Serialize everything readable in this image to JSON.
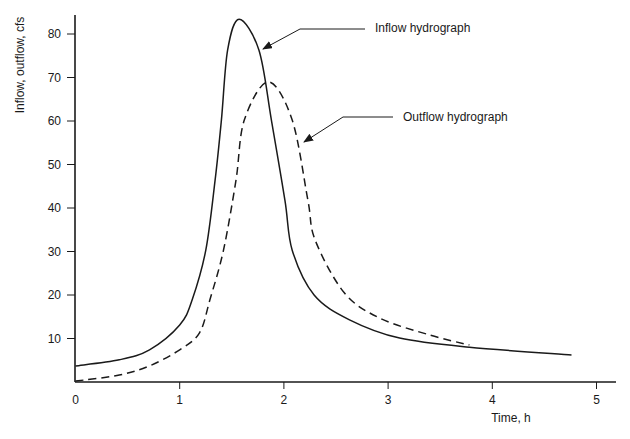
{
  "chart_data": {
    "type": "line",
    "title": "",
    "xlabel": "Time, h",
    "ylabel": "Inflow, outflow, cfs",
    "xlim": [
      0,
      5.2
    ],
    "ylim": [
      0,
      86
    ],
    "xticks": [
      0,
      1,
      2,
      3,
      4,
      5
    ],
    "yticks": [
      10,
      20,
      30,
      40,
      50,
      60,
      70,
      80
    ],
    "grid": false,
    "legend": "none (direct annotations with arrows)",
    "series": [
      {
        "name": "Inflow hydrograph",
        "style": "solid",
        "x": [
          0,
          0.42,
          0.71,
          1.0,
          1.12,
          1.25,
          1.34,
          1.4,
          1.46,
          1.57,
          1.76,
          1.88,
          2.01,
          2.08,
          2.29,
          2.63,
          3.11,
          3.78,
          4.76
        ],
        "y": [
          3.7,
          5.1,
          7.4,
          13.1,
          18.9,
          30.3,
          46.4,
          60.2,
          76.3,
          83.4,
          76.3,
          60.2,
          41.8,
          30.3,
          20.0,
          14.3,
          10.1,
          8.0,
          6.2
        ]
      },
      {
        "name": "Outflow hydrograph",
        "style": "dashed",
        "x": [
          0,
          0.42,
          0.71,
          1.0,
          1.19,
          1.29,
          1.42,
          1.54,
          1.62,
          1.85,
          2.08,
          2.23,
          2.3,
          2.58,
          2.92,
          3.4,
          3.78
        ],
        "y": [
          0.2,
          1.6,
          3.7,
          7.4,
          11.3,
          18.9,
          30.3,
          46.4,
          60.2,
          69.0,
          60.2,
          41.8,
          32.6,
          20.5,
          14.7,
          10.8,
          8.5
        ]
      }
    ],
    "annotations": [
      {
        "text": "Inflow hydrograph",
        "arrow_to": [
          1.8,
          76.5
        ],
        "text_at": [
          2.87,
          81
        ]
      },
      {
        "text": "Outflow hydrograph",
        "arrow_to": [
          2.19,
          55
        ],
        "text_at": [
          3.14,
          61
        ]
      }
    ]
  },
  "labels": {
    "ylabel": "Inflow, outflow, cfs",
    "xlabel": "Time, h",
    "inflow": "Inflow hydrograph",
    "outflow": "Outflow hydrograph"
  },
  "colors": {
    "line": "#1a1a1a",
    "axis": "#1a1a1a",
    "background": "#ffffff"
  }
}
